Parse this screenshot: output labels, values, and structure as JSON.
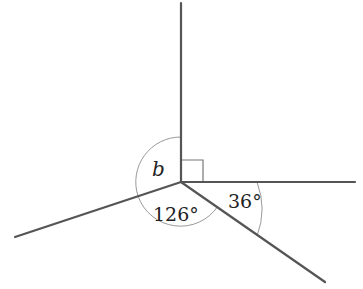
{
  "diagram": {
    "type": "angles-at-a-point",
    "center": [
      181,
      182
    ],
    "rays": [
      {
        "name": "up",
        "end": [
          181,
          3
        ]
      },
      {
        "name": "right",
        "end": [
          355,
          182
        ]
      },
      {
        "name": "lower-right",
        "end": [
          325,
          282
        ]
      },
      {
        "name": "lower-left",
        "end": [
          15,
          237
        ]
      }
    ],
    "labels": {
      "b": "b",
      "angle_126": "126°",
      "angle_36": "36°"
    },
    "right_angle_marker": true,
    "colors": {
      "line": "#555555",
      "arc": "#999999",
      "text": "#222222"
    }
  }
}
